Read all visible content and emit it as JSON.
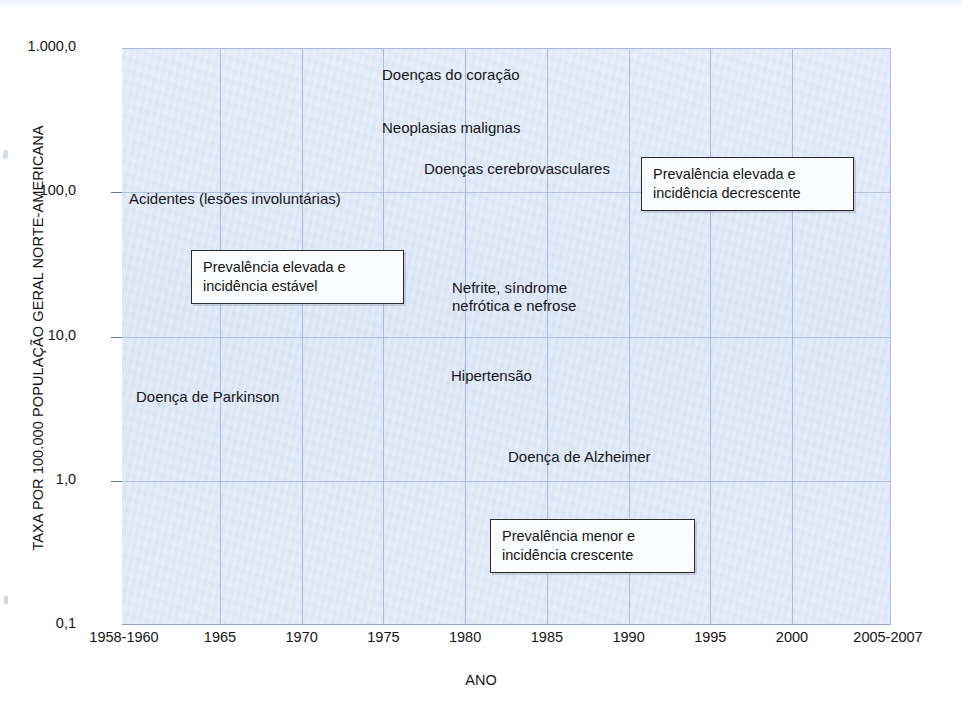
{
  "chart_data": {
    "type": "line",
    "title": "",
    "xlabel": "ANO",
    "ylabel": "TAXA POR 100.000 POPULAÇÃO GERAL NORTE-AMERICANA",
    "yscale": "log",
    "ylim": [
      0.1,
      1000.0
    ],
    "ytick_labels": [
      "1.000,0",
      "100,0",
      "10,0",
      "1,0",
      "0,1"
    ],
    "ytick_values": [
      1000.0,
      100.0,
      10.0,
      1.0,
      0.1
    ],
    "xtick_labels": [
      "1958-1960",
      "1965",
      "1970",
      "1975",
      "1980",
      "1985",
      "1990",
      "1995",
      "2000",
      "2005-2007"
    ],
    "xtick_values": [
      1959,
      1965,
      1970,
      1975,
      1980,
      1985,
      1990,
      1995,
      2000,
      2006
    ],
    "xlim": [
      1959,
      2006
    ],
    "grid": true,
    "legend": "inline-labels",
    "series": [
      {
        "name": "Doenças do coração",
        "color": "#121212",
        "x": [
          1959,
          1965,
          1970,
          1975,
          1980,
          1985,
          1990,
          1995,
          2000,
          2006
        ],
        "values": [
          520,
          510,
          470,
          430,
          400,
          360,
          320,
          290,
          255,
          200
        ]
      },
      {
        "name": "Neoplasias malignas",
        "color": "#2746b4",
        "x": [
          1959,
          1965,
          1970,
          1975,
          1980,
          1985,
          1990,
          1995,
          2000,
          2006
        ],
        "values": [
          190,
          190,
          190,
          190,
          195,
          198,
          200,
          200,
          195,
          182
        ]
      },
      {
        "name": "Doenças cerebrovasculares",
        "color": "#7c838c",
        "x": [
          1959,
          1965,
          1970,
          1975,
          1980,
          1985,
          1990,
          1995,
          2000,
          2006
        ],
        "values": [
          182,
          170,
          145,
          110,
          88,
          75,
          68,
          63,
          58,
          45
        ]
      },
      {
        "name": "Acidentes (lesões involuntárias)",
        "color": "#2b4fc0",
        "x": [
          1959,
          1965,
          1970,
          1975,
          1980,
          1985,
          1990,
          1995,
          2000,
          2006
        ],
        "values": [
          68,
          70,
          72,
          64,
          57,
          45,
          42,
          40,
          40,
          43
        ]
      },
      {
        "name": "Nefrite, síndrome nefrótica e nefrose",
        "color": "#8d949c",
        "x": [
          1959,
          1965,
          1970,
          1975,
          1980,
          1985,
          1990,
          1995,
          2000,
          2006
        ],
        "values": [
          14.0,
          11.0,
          8.0,
          4.4,
          3.3,
          3.6,
          4.5,
          5.5,
          7.0,
          8.0
        ]
      },
      {
        "name": "Hipertensão",
        "color": "#8a9bdf",
        "x": [
          1959,
          1965,
          1970,
          1975,
          1979,
          1980,
          1985,
          1990,
          1995,
          2000,
          2006
        ],
        "values": [
          13.0,
          11.0,
          8.2,
          5.0,
          4.6,
          10.0,
          10.2,
          10.6,
          11.0,
          13.5,
          14.5
        ]
      },
      {
        "name": "Doença de Parkinson",
        "color": "#2b4fc0",
        "x": [
          1959,
          1965,
          1970,
          1975,
          1980,
          1985,
          1990,
          1995,
          2000,
          2006
        ],
        "values": [
          2.5,
          2.4,
          2.3,
          2.1,
          2.0,
          2.3,
          2.8,
          3.2,
          5.2,
          6.6
        ]
      },
      {
        "name": "Doença de Alzheimer",
        "color": "#4a4f55",
        "x": [
          1980,
          1982,
          1985,
          1990,
          1995,
          1998,
          1999,
          2000,
          2006
        ],
        "values": [
          0.3,
          1.5,
          3.6,
          5.4,
          7.6,
          9.5,
          17.0,
          19.0,
          23.0
        ]
      }
    ],
    "annotations": [
      {
        "id": "high-prevalence-decreasing",
        "lines": [
          "Prevalência elevada e",
          "incidência decrescente"
        ]
      },
      {
        "id": "high-prevalence-stable",
        "lines": [
          "Prevalência elevada e",
          "incidência estável"
        ]
      },
      {
        "id": "low-prevalence-increasing",
        "lines": [
          "Prevalência menor e",
          "incidência crescente"
        ]
      }
    ],
    "series_label_text": {
      "heart": "Doenças do coração",
      "neoplasms": "Neoplasias malignas",
      "cerebrovascular": "Doenças cerebrovasculares",
      "accidents": "Acidentes (lesões involuntárias)",
      "nephritis_line1": "Nefrite, síndrome",
      "nephritis_line2": "nefrótica e nefrose",
      "hypertension": "Hipertensão",
      "parkinson": "Doença de Parkinson",
      "alzheimer": "Doença de Alzheimer"
    },
    "colors": {
      "plot_background": "#dde7f7",
      "gridline": "#97a8cf",
      "heart": "#121212",
      "neoplasms": "#2746b4",
      "cerebrovascular": "#7c838c",
      "accidents": "#2b4fc0",
      "nephritis": "#8d949c",
      "hypertension": "#8a9bdf",
      "parkinson": "#2b4fc0",
      "alzheimer": "#4a4f55"
    }
  }
}
